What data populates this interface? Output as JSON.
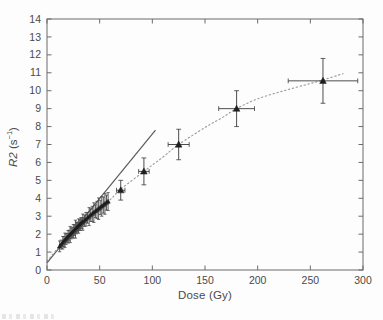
{
  "figure": {
    "background": "#fdfdfd",
    "caption_artifact": "faint cropped text at bottom-left edge (illegible)"
  },
  "chart_data": {
    "type": "scatter",
    "title": "",
    "xlabel": "Dose (Gy)",
    "ylabel": "R2 (s−1)",
    "ylabel_parts": {
      "variable": "R2",
      "open": " (s",
      "exponent": "−1",
      "close": ")"
    },
    "xlim": [
      0,
      300
    ],
    "ylim": [
      0,
      14
    ],
    "xticks": [
      0,
      50,
      100,
      150,
      200,
      250,
      300
    ],
    "yticks": [
      0,
      1,
      2,
      3,
      4,
      5,
      6,
      7,
      8,
      9,
      10,
      11,
      12,
      13,
      14
    ],
    "grid": false,
    "legend": null,
    "marker": "filled-up-triangle",
    "colors": {
      "marker": "#1f1f1f",
      "error_bar": "#3a3a3a",
      "cluster_error_bar": "#4a4a4a",
      "linear_fit": "#5a5a5a",
      "curve_fit": "#9a9a9a",
      "axis": "#6b6b6b",
      "tick_label": "#4a4a4a"
    },
    "series": [
      {
        "name": "measured-cluster",
        "type": "scatter-yerr",
        "point_format": [
          "dose_gy",
          "r2_s-1",
          "yerr"
        ],
        "points": [
          [
            12,
            1.32,
            0.3
          ],
          [
            13.5,
            1.42,
            0.25
          ],
          [
            15,
            1.52,
            0.35
          ],
          [
            16,
            1.59,
            0.28
          ],
          [
            17,
            1.66,
            0.4
          ],
          [
            18,
            1.72,
            0.3
          ],
          [
            19,
            1.79,
            0.25
          ],
          [
            20,
            1.85,
            0.35
          ],
          [
            21,
            1.92,
            0.3
          ],
          [
            22,
            1.98,
            0.45
          ],
          [
            23,
            2.04,
            0.3
          ],
          [
            24,
            2.1,
            0.28
          ],
          [
            25,
            2.16,
            0.38
          ],
          [
            26,
            2.22,
            0.3
          ],
          [
            27,
            2.28,
            0.5
          ],
          [
            28,
            2.34,
            0.32
          ],
          [
            29,
            2.39,
            0.28
          ],
          [
            30,
            2.45,
            0.4
          ],
          [
            31,
            2.51,
            0.3
          ],
          [
            32,
            2.56,
            0.35
          ],
          [
            33,
            2.62,
            0.3
          ],
          [
            34,
            2.67,
            0.45
          ],
          [
            35.5,
            2.75,
            0.32
          ],
          [
            37,
            2.83,
            0.38
          ],
          [
            38.5,
            2.91,
            0.3
          ],
          [
            40,
            2.98,
            0.5
          ],
          [
            41.5,
            3.06,
            0.35
          ],
          [
            43,
            3.13,
            0.42
          ],
          [
            44.5,
            3.2,
            0.55
          ],
          [
            46,
            3.28,
            0.35
          ],
          [
            47.5,
            3.35,
            0.48
          ],
          [
            49,
            3.42,
            0.6
          ],
          [
            50.5,
            3.49,
            0.4
          ],
          [
            52,
            3.55,
            0.55
          ],
          [
            53.5,
            3.62,
            0.45
          ],
          [
            55,
            3.69,
            0.58
          ],
          [
            56.5,
            3.76,
            0.42
          ],
          [
            58,
            3.82,
            0.5
          ]
        ]
      },
      {
        "name": "measured-points",
        "type": "scatter-xyerr",
        "point_format": [
          "dose_gy",
          "r2_s-1",
          "xerr",
          "yerr"
        ],
        "points": [
          [
            70,
            4.45,
            4,
            0.55
          ],
          [
            92,
            5.5,
            5,
            0.75
          ],
          [
            125,
            7.0,
            10,
            0.85
          ],
          [
            180,
            9.0,
            17,
            1.0
          ],
          [
            262,
            10.55,
            33,
            1.25
          ]
        ]
      },
      {
        "name": "linear-fit",
        "type": "line",
        "style": "solid",
        "x": [
          0,
          103
        ],
        "y": [
          0.4,
          7.8
        ]
      },
      {
        "name": "saturating-fit",
        "type": "curve",
        "style": "dotted",
        "points": [
          [
            0,
            0.5
          ],
          [
            12,
            1.33
          ],
          [
            25,
            2.16
          ],
          [
            40,
            2.98
          ],
          [
            58,
            3.82
          ],
          [
            70,
            4.5
          ],
          [
            92,
            5.5
          ],
          [
            110,
            6.3
          ],
          [
            125,
            7.0
          ],
          [
            150,
            7.95
          ],
          [
            165,
            8.45
          ],
          [
            180,
            9.0
          ],
          [
            200,
            9.55
          ],
          [
            225,
            10.0
          ],
          [
            250,
            10.4
          ],
          [
            262,
            10.6
          ],
          [
            281,
            10.95
          ]
        ]
      }
    ]
  }
}
